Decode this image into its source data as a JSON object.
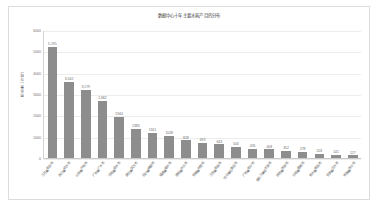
{
  "chart_data": {
    "type": "bar",
    "title": "数据中心十年主要水耗产目的分布",
    "xlabel": "",
    "ylabel": "用水量（万吨）",
    "ylim": [
      0,
      6000
    ],
    "grid": true,
    "legend": "none",
    "bar_color": "#8d8d8d",
    "y_ticks": [
      "0",
      "1000",
      "2000",
      "3000",
      "4000",
      "5000",
      "6000"
    ],
    "categories": [
      "江苏省南京市",
      "浙江省杭州市",
      "山东省济南市",
      "广东省广州市",
      "河南省郑州市",
      "湖北省武汉市",
      "四川省成都市",
      "福建省福州市",
      "湖南省长沙市",
      "安徽省合肥市",
      "江西省南昌市",
      "河北省石家庄市",
      "广西省南宁市",
      "黑龙江省哈尔滨市",
      "陕西省西安市",
      "云南省昆明市",
      "贵州省贵阳市",
      "甘肃省兰州市",
      "青海省西宁市"
    ],
    "values": [
      5195,
      3562,
      3179,
      2682,
      1944,
      1383,
      1161,
      1028,
      828,
      693,
      643,
      504,
      435,
      408,
      352,
      278,
      203,
      141,
      127
    ],
    "value_labels": [
      "5,195",
      "3,562",
      "3,179",
      "2,682",
      "1944",
      "1383",
      "1161",
      "1028",
      "828",
      "693",
      "643",
      "504",
      "435",
      "408",
      "352",
      "278",
      "203",
      "141",
      "127"
    ]
  },
  "frame": {
    "border_color": "#dcdcdc",
    "background": "#ffffff"
  }
}
